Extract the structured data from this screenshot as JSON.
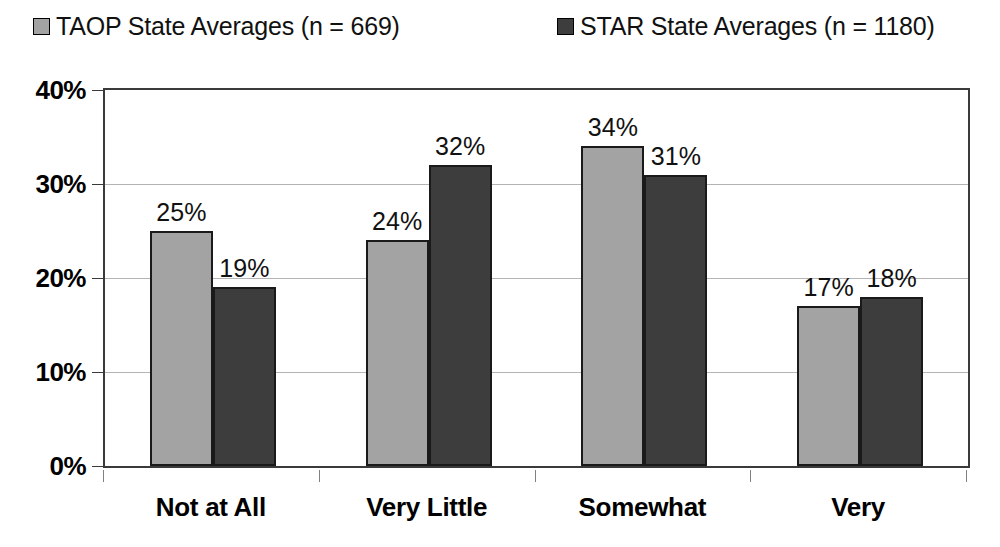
{
  "chart_data": {
    "type": "bar",
    "title": "",
    "xlabel": "",
    "ylabel": "",
    "ylim": [
      0,
      40
    ],
    "yticks": [
      "0%",
      "10%",
      "20%",
      "30%",
      "40%"
    ],
    "ytick_values": [
      0,
      10,
      20,
      30,
      40
    ],
    "grid": true,
    "legend_position": "top",
    "categories": [
      "Not at All",
      "Very Little",
      "Somewhat",
      "Very"
    ],
    "series": [
      {
        "name": "TAOP State Averages (n = 669)",
        "short_name": "TAOP",
        "n": 669,
        "color": "#a3a3a3",
        "values": [
          25,
          24,
          34,
          17
        ],
        "labels": [
          "25%",
          "24%",
          "34%",
          "17%"
        ]
      },
      {
        "name": "STAR State Averages (n = 1180)",
        "short_name": "STAR",
        "n": 1180,
        "color": "#3d3d3d",
        "values": [
          19,
          32,
          31,
          18
        ],
        "labels": [
          "19%",
          "32%",
          "31%",
          "18%"
        ]
      }
    ]
  },
  "legend": {
    "entries": [
      {
        "label": "TAOP State Averages (n = 669)",
        "color": "#a3a3a3"
      },
      {
        "label": "STAR State Averages (n = 1180)",
        "color": "#3d3d3d"
      }
    ]
  },
  "axes": {
    "y": {
      "ticks": [
        "0%",
        "10%",
        "20%",
        "30%",
        "40%"
      ]
    },
    "x": {
      "ticks": [
        "Not at All",
        "Very Little",
        "Somewhat",
        "Very"
      ]
    }
  }
}
